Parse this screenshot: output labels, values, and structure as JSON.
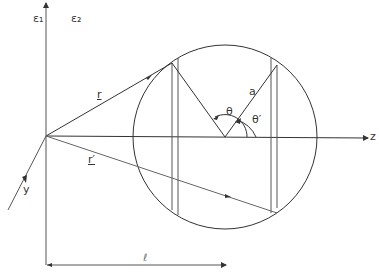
{
  "diagram": {
    "labels": {
      "eps1": "ε₁",
      "eps2": "ε₂",
      "r": "r",
      "r_prime": "r′",
      "a": "a",
      "theta": "θ",
      "theta_prime": "θ′",
      "z_axis": "z",
      "y_axis": "y",
      "length": "ℓ"
    },
    "colors": {
      "line": "#333333",
      "light_line": "#666666"
    },
    "geometry": {
      "origin": [
        46,
        136
      ],
      "sphere_center": [
        225,
        137
      ],
      "sphere_radius": 92
    }
  }
}
